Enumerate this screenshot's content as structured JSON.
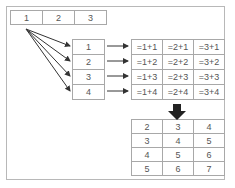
{
  "top_row": [
    "1",
    "2",
    "3"
  ],
  "left_column": [
    "1",
    "2",
    "3",
    "4"
  ],
  "formula_table": [
    [
      "=1+1",
      "=2+1",
      "=3+1"
    ],
    [
      "=1+2",
      "=2+2",
      "=3+2"
    ],
    [
      "=1+3",
      "=2+3",
      "=3+3"
    ],
    [
      "=1+4",
      "=2+4",
      "=3+4"
    ]
  ],
  "result_table": [
    [
      "2",
      "3",
      "4"
    ],
    [
      "3",
      "4",
      "5"
    ],
    [
      "4",
      "5",
      "6"
    ],
    [
      "5",
      "6",
      "7"
    ]
  ],
  "colors": {
    "border": "#a8a8a8",
    "text": "#555555",
    "arrow": "#333333"
  }
}
